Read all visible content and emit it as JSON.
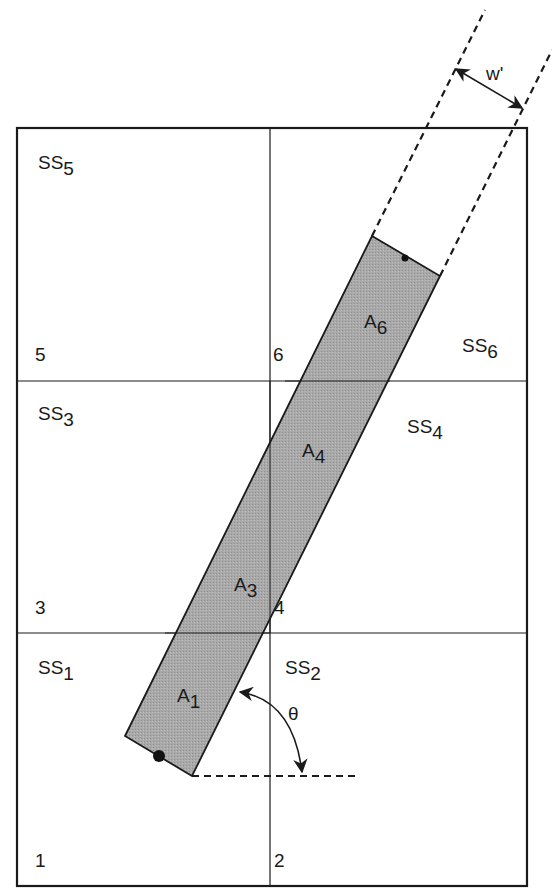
{
  "diagram": {
    "width_label": "w'",
    "angle_label": "θ",
    "subsections": [
      {
        "name": "SS",
        "sub": "1"
      },
      {
        "name": "SS",
        "sub": "2"
      },
      {
        "name": "SS",
        "sub": "3"
      },
      {
        "name": "SS",
        "sub": "4"
      },
      {
        "name": "SS",
        "sub": "5"
      },
      {
        "name": "SS",
        "sub": "6"
      }
    ],
    "areas": [
      {
        "name": "A",
        "sub": "1"
      },
      {
        "name": "A",
        "sub": "3"
      },
      {
        "name": "A",
        "sub": "4"
      },
      {
        "name": "A",
        "sub": "6"
      }
    ],
    "corner_numbers": [
      "1",
      "2",
      "3",
      "4",
      "5",
      "6"
    ],
    "colors": {
      "strip_fill": "#a9a9a9",
      "line": "#1a1a1a",
      "background": "#ffffff"
    }
  }
}
